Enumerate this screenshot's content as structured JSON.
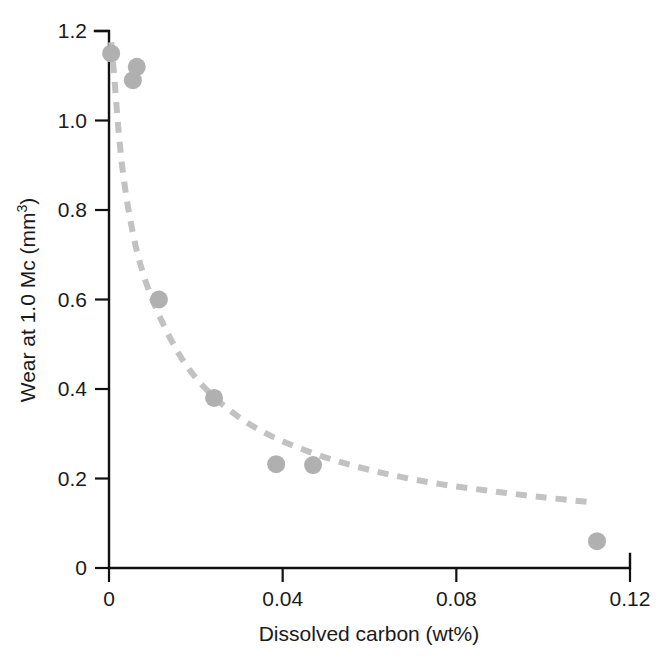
{
  "chart_data": {
    "type": "scatter",
    "title": "",
    "subtitle": "",
    "xlabel": "Dissolved carbon (wt%)",
    "ylabel_text": "Wear at 1.0 Mc (mm",
    "ylabel_superscript": "3",
    "ylabel_tail": ")",
    "ylabel_full": "Wear at 1.0 Mc (mm3)",
    "xlim": [
      0,
      0.12
    ],
    "ylim": [
      0,
      1.2
    ],
    "xticks": [
      0,
      0.04,
      0.08,
      0.12
    ],
    "xtick_labels": [
      "0",
      "0.04",
      "0.08",
      "0.12"
    ],
    "yticks": [
      0,
      0.2,
      0.4,
      0.6,
      0.8,
      1.0,
      1.2
    ],
    "ytick_labels": [
      "0",
      "0.2",
      "0.4",
      "0.6",
      "0.8",
      "1.0",
      "1.2"
    ],
    "grid": false,
    "legend": null,
    "marker_color": "#b0b0b0",
    "marker_size_px": 18,
    "curve_color": "#c2c2c2",
    "curve_style": "dashed",
    "curve_width_px": 6,
    "axis_color": "#111111",
    "points": [
      {
        "x": 0.0005,
        "y": 1.15
      },
      {
        "x": 0.0055,
        "y": 1.09
      },
      {
        "x": 0.0064,
        "y": 1.12
      },
      {
        "x": 0.0115,
        "y": 0.6
      },
      {
        "x": 0.0242,
        "y": 0.38
      },
      {
        "x": 0.0385,
        "y": 0.232
      },
      {
        "x": 0.047,
        "y": 0.23
      },
      {
        "x": 0.1124,
        "y": 0.06
      }
    ],
    "fit_curve": [
      {
        "x": 0.0005,
        "y": 1.175
      },
      {
        "x": 0.0012,
        "y": 1.1
      },
      {
        "x": 0.002,
        "y": 1.0
      },
      {
        "x": 0.003,
        "y": 0.9
      },
      {
        "x": 0.0045,
        "y": 0.8
      },
      {
        "x": 0.0065,
        "y": 0.705
      },
      {
        "x": 0.009,
        "y": 0.625
      },
      {
        "x": 0.012,
        "y": 0.555
      },
      {
        "x": 0.016,
        "y": 0.48
      },
      {
        "x": 0.02,
        "y": 0.425
      },
      {
        "x": 0.025,
        "y": 0.375
      },
      {
        "x": 0.031,
        "y": 0.33
      },
      {
        "x": 0.038,
        "y": 0.292
      },
      {
        "x": 0.046,
        "y": 0.26
      },
      {
        "x": 0.055,
        "y": 0.232
      },
      {
        "x": 0.065,
        "y": 0.208
      },
      {
        "x": 0.076,
        "y": 0.188
      },
      {
        "x": 0.088,
        "y": 0.172
      },
      {
        "x": 0.1,
        "y": 0.158
      },
      {
        "x": 0.112,
        "y": 0.146
      }
    ]
  }
}
